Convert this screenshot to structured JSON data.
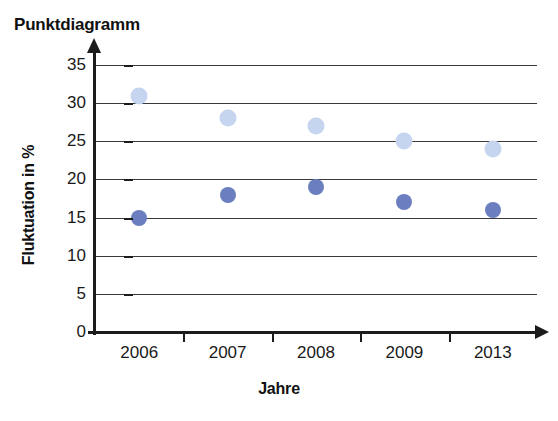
{
  "chart_data": {
    "type": "scatter",
    "title": "Punktdiagramm",
    "xlabel": "Jahre",
    "ylabel": "Fluktuation in %",
    "categories": [
      "2006",
      "2007",
      "2008",
      "2009",
      "2013"
    ],
    "ylim": [
      0,
      35
    ],
    "yticks": [
      0,
      5,
      10,
      15,
      20,
      25,
      30,
      35
    ],
    "ytick_labels": [
      "0",
      "5",
      "10",
      "15",
      "20",
      "25",
      "30",
      "35"
    ],
    "grid": true,
    "legend": "none",
    "series": [
      {
        "name": "obere Reihe",
        "color": "#c5d5ef",
        "values": [
          31,
          28,
          27,
          25,
          24
        ]
      },
      {
        "name": "untere Reihe",
        "color": "#6b7fc0",
        "values": [
          15,
          18,
          19,
          17,
          16
        ]
      }
    ]
  }
}
